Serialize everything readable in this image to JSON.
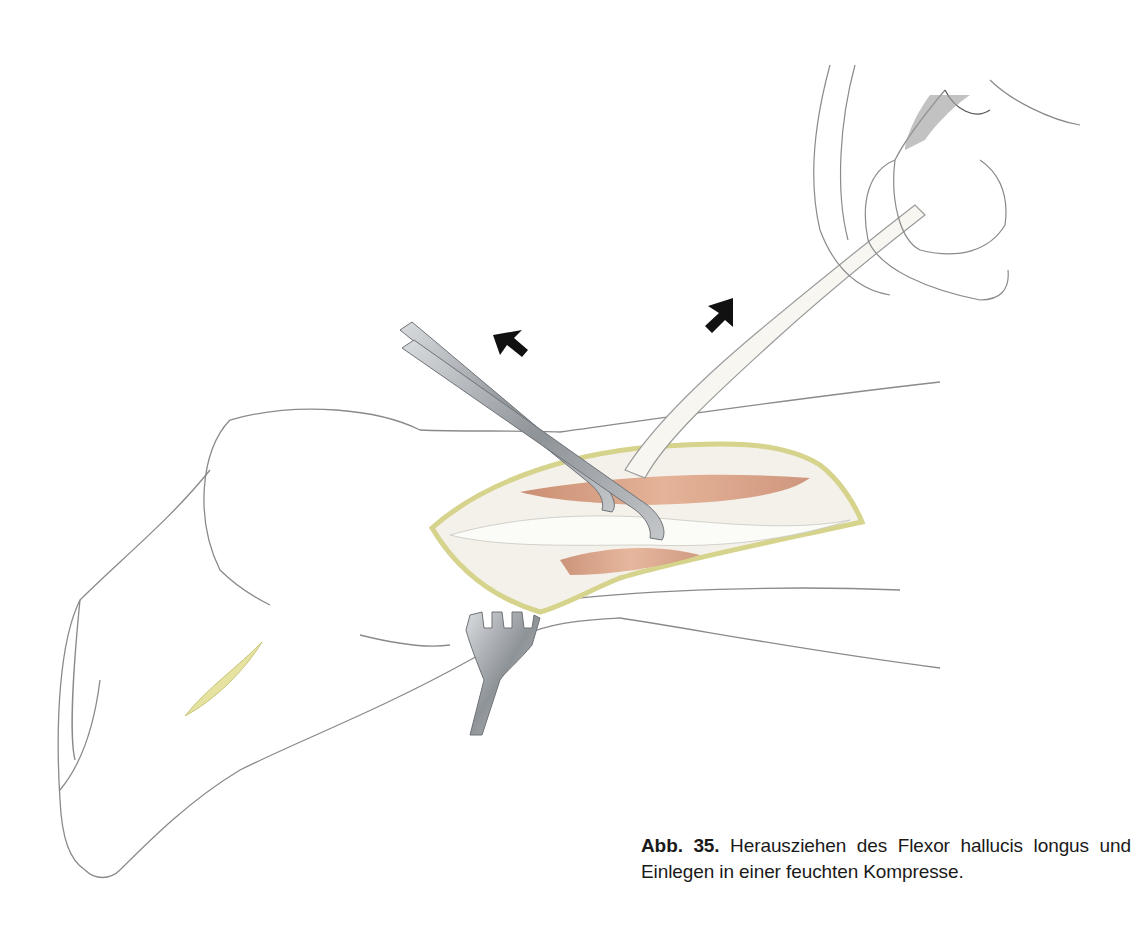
{
  "figure": {
    "label": "Abb. 35.",
    "caption_line1": "Herausziehen des Flexor hallucis longus",
    "caption_line2": "und Einlegen in einer feuchten Kompresse.",
    "illustration": {
      "subject": "surgical illustration of foot with open incision",
      "elements": [
        "foot-outline",
        "incision-wound",
        "tendon",
        "forceps",
        "retractor",
        "gauze-compress-hand",
        "direction-arrow-left",
        "direction-arrow-right",
        "small-incision"
      ],
      "colors": {
        "outline": "#8a8a8a",
        "wound_edge": "#d8d690",
        "muscle": "#c98a6a",
        "instrument": "#9a9ea3",
        "arrow": "#111111"
      }
    }
  }
}
